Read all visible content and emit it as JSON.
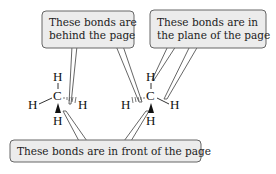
{
  "callouts": {
    "behind": {
      "line1": "These bonds are",
      "line2": "behind the page"
    },
    "plane": {
      "line1": "These bonds are in",
      "line2": "the plane of the page"
    },
    "front": {
      "line1": "These bonds are in front of the page"
    }
  },
  "molecules": [
    {
      "name": "methane-left",
      "center": "C",
      "atoms": {
        "top": "H",
        "left": "H",
        "right": "H",
        "bottom": "H"
      },
      "bond_types": {
        "top": "plane",
        "left": "plane",
        "right": "hashed-behind",
        "bottom": "wedge-front"
      }
    },
    {
      "name": "methane-right",
      "center": "C",
      "atoms": {
        "top": "H",
        "left": "H",
        "right": "H",
        "bottom": "H"
      },
      "bond_types": {
        "top": "plane",
        "left": "hashed-behind",
        "right": "plane",
        "bottom": "wedge-front"
      }
    }
  ],
  "colors": {
    "box_fill": "#ececec",
    "box_stroke": "#666666",
    "text": "#222222"
  }
}
